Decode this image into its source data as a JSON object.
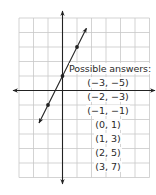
{
  "graph": {
    "grid": {
      "x_min": -3,
      "x_max": 6,
      "y_min": -6,
      "y_max": 5,
      "unit_px": 14.5,
      "origin_px": [
        62.5,
        90.5
      ],
      "line_color": "#c8c8c8"
    },
    "axes": {
      "color": "#222222"
    },
    "line": {
      "equation": "y = 2x + 1",
      "slope": 2,
      "intercept": 1,
      "color": "#222222",
      "points": [
        [
          -1,
          -1
        ],
        [
          0,
          1
        ],
        [
          1,
          3
        ]
      ]
    }
  },
  "answers": {
    "title": "Possible answers:",
    "items": [
      "(−3, −5)",
      "(−2, −3)",
      "(−1, −1)",
      "(0, 1)",
      "(1, 3)",
      "(2, 5)",
      "(3, 7)"
    ]
  },
  "chart_data": {
    "type": "line",
    "title": "",
    "xlabel": "",
    "ylabel": "",
    "xlim": [
      -3,
      6
    ],
    "ylim": [
      -6,
      5
    ],
    "grid": true,
    "series": [
      {
        "name": "y = 2x + 1",
        "x": [
          -1,
          0,
          1
        ],
        "y": [
          -1,
          1,
          3
        ]
      }
    ],
    "annotations": [
      "Possible answers:",
      "(−3, −5)",
      "(−2, −3)",
      "(−1, −1)",
      "(0, 1)",
      "(1, 3)",
      "(2, 5)",
      "(3, 7)"
    ]
  }
}
